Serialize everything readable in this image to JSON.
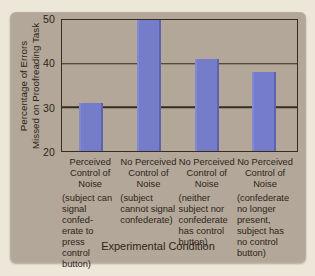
{
  "colors": {
    "page_background": "#ece7d8",
    "panel_background": "#b2a799",
    "bar_fill": "#757cc9",
    "line": "#362c20",
    "text": "#2e2518"
  },
  "chart_data": {
    "type": "bar",
    "ylabel": "Percentage of Errors\nMissed on Proofreading Task",
    "xlabel": "Experimental Condition",
    "ylim": [
      20,
      50
    ],
    "yticks": [
      20,
      30,
      40,
      50
    ],
    "grid": "horizontal gridlines at 30 and 40, full box frame around plot",
    "legend": "none",
    "categories": [
      {
        "label_lines": [
          "Perceived",
          "Control of",
          "Noise"
        ],
        "detail_lines": [
          "(subject can",
          "signal confed-",
          "erate to press",
          "control button)"
        ]
      },
      {
        "label_lines": [
          "No Perceived",
          "Control of",
          "Noise"
        ],
        "detail_lines": [
          "(subject",
          "cannot signal",
          "confederate)"
        ]
      },
      {
        "label_lines": [
          "No Perceived",
          "Control of",
          "Noise"
        ],
        "detail_lines": [
          "(neither",
          "subject nor",
          "confederate",
          "has control",
          "button)"
        ]
      },
      {
        "label_lines": [
          "No Perceived",
          "Control of",
          "Noise"
        ],
        "detail_lines": [
          "(confederate",
          "no longer",
          "present,",
          "subject has",
          "no control",
          "button)"
        ]
      }
    ],
    "values": [
      31,
      50,
      41,
      38
    ]
  }
}
